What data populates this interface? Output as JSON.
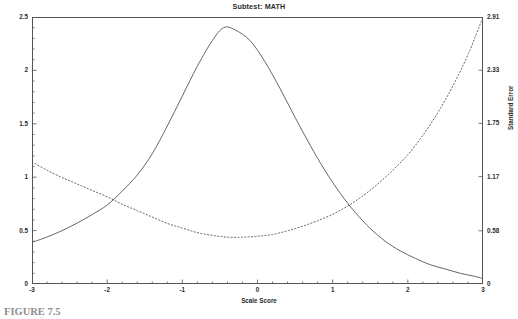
{
  "chart_data": {
    "type": "line",
    "title": "Subtest: MATH",
    "xlabel": "Scale Score",
    "ylabel": "Information",
    "y2label": "Standard Error",
    "xlim": [
      -3,
      3
    ],
    "ylim": [
      0,
      2.5
    ],
    "y2lim": [
      0,
      2.91
    ],
    "grid": false,
    "legend": "none",
    "xticks": [
      "-3",
      "-2",
      "-1",
      "0",
      "1",
      "2",
      "3"
    ],
    "xtick_values": [
      -3,
      -2,
      -1,
      0,
      1,
      2,
      3
    ],
    "xminor_per_interval": 4,
    "yticks": [
      "0",
      "0.5",
      "1",
      "1.5",
      "2",
      "2.5"
    ],
    "ytick_values": [
      0,
      0.5,
      1,
      1.5,
      2,
      2.5
    ],
    "y2ticks": [
      "0",
      "0.58",
      "1.17",
      "1.75",
      "2.33",
      "2.91"
    ],
    "y2tick_values": [
      0,
      0.58,
      1.17,
      1.75,
      2.33,
      2.91
    ],
    "series": [
      {
        "name": "Information",
        "axis": "left",
        "style": "solid",
        "color": "#555555",
        "x": [
          -3.0,
          -2.8,
          -2.6,
          -2.4,
          -2.2,
          -2.0,
          -1.8,
          -1.6,
          -1.4,
          -1.2,
          -1.0,
          -0.8,
          -0.6,
          -0.45,
          -0.3,
          -0.1,
          0.1,
          0.3,
          0.5,
          0.7,
          0.9,
          1.1,
          1.3,
          1.5,
          1.7,
          1.9,
          2.1,
          2.3,
          2.5,
          2.7,
          2.9,
          3.0
        ],
        "values": [
          0.39,
          0.44,
          0.5,
          0.57,
          0.65,
          0.74,
          0.87,
          1.02,
          1.22,
          1.48,
          1.76,
          2.04,
          2.28,
          2.4,
          2.38,
          2.28,
          2.08,
          1.83,
          1.56,
          1.3,
          1.06,
          0.85,
          0.67,
          0.52,
          0.4,
          0.31,
          0.24,
          0.18,
          0.14,
          0.1,
          0.07,
          0.05
        ]
      },
      {
        "name": "Standard Error",
        "axis": "right",
        "style": "dotted",
        "color": "#555555",
        "x": [
          -3.0,
          -2.8,
          -2.6,
          -2.4,
          -2.2,
          -2.0,
          -1.8,
          -1.6,
          -1.4,
          -1.2,
          -1.0,
          -0.8,
          -0.6,
          -0.4,
          -0.2,
          0.0,
          0.2,
          0.4,
          0.6,
          0.8,
          1.0,
          1.2,
          1.4,
          1.6,
          1.8,
          2.0,
          2.2,
          2.4,
          2.6,
          2.8,
          3.0
        ],
        "values": [
          1.33,
          1.24,
          1.16,
          1.09,
          1.02,
          0.95,
          0.87,
          0.8,
          0.73,
          0.66,
          0.61,
          0.56,
          0.53,
          0.51,
          0.51,
          0.52,
          0.54,
          0.58,
          0.63,
          0.69,
          0.76,
          0.85,
          0.96,
          1.09,
          1.24,
          1.41,
          1.62,
          1.87,
          2.16,
          2.5,
          2.91
        ]
      }
    ]
  },
  "caption": {
    "text": "FIGURE 7.5"
  }
}
